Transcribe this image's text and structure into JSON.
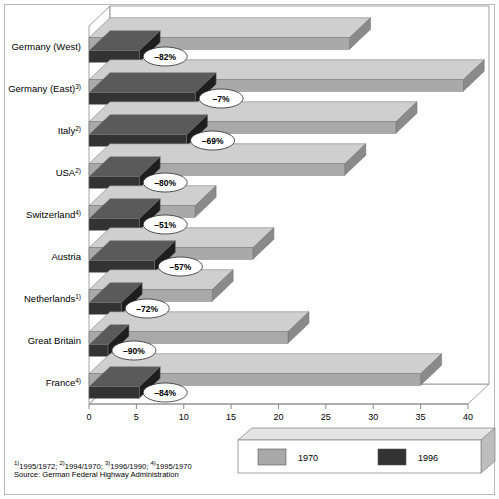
{
  "chart_data": {
    "type": "bar",
    "orientation": "horizontal",
    "title": "Fatalities per billion vehicle miles",
    "xlabel": "",
    "ylabel": "",
    "xlim": [
      0,
      40
    ],
    "xticks": [
      0,
      5,
      10,
      15,
      20,
      25,
      30,
      35,
      40
    ],
    "xtick_labels": [
      "0",
      "5",
      "10",
      "15",
      "20",
      "25",
      "30",
      "35",
      "40"
    ],
    "grid": false,
    "legend_position": "bottom-right",
    "style_3d": true,
    "categories": [
      "Germany (West)",
      "Germany (East)",
      "Italy",
      "USA",
      "Switzerland",
      "Austria",
      "Netherlands",
      "Great Britain",
      "France"
    ],
    "category_footnote_marks": [
      "",
      "3)",
      "2)",
      "2)",
      "4)",
      "",
      "1)",
      "",
      "4)"
    ],
    "series": [
      {
        "name": "1970",
        "color": "#a9a9a9",
        "values": [
          27.5,
          39.5,
          32.4,
          27.0,
          11.2,
          17.3,
          13.0,
          21.0,
          35.0
        ]
      },
      {
        "name": "1996",
        "color": "#333333",
        "values": [
          5.3,
          11.2,
          10.3,
          5.3,
          5.3,
          6.9,
          3.4,
          2.0,
          5.3
        ]
      }
    ],
    "annotations": [
      "–82%",
      "–7%",
      "–69%",
      "–80%",
      "–51%",
      "–57%",
      "–72%",
      "–90%",
      "–84%"
    ],
    "annotation_note": "percent change between the two years shown per country"
  },
  "legend": {
    "entries": [
      {
        "label": "1970",
        "color": "#a9a9a9"
      },
      {
        "label": "1996",
        "color": "#333333"
      }
    ]
  },
  "footer": {
    "footnotes_prefix_1": "1)",
    "footnotes_text_1": "1995/1972;  ",
    "footnotes_prefix_2": "2)",
    "footnotes_text_2": "1994/1970;  ",
    "footnotes_prefix_3": "3)",
    "footnotes_text_3": "1996/1990;  ",
    "footnotes_prefix_4": "4)",
    "footnotes_text_4": "1995/1970",
    "footnotes_full": "1)1995/1972;  2)1994/1970;  3)1996/1990;  4)1995/1970",
    "source": "Source: German Federal Highway Administration"
  },
  "colors": {
    "bar_1970_front": "#a9a9a9",
    "bar_1970_top": "#cfcfcf",
    "bar_1970_side": "#8a8a8a",
    "bar_1996_front": "#333333",
    "bar_1996_top": "#5a5a5a",
    "bar_1996_side": "#1e1e1e",
    "axis": "#8a8a8a",
    "frame": "#b9b9b9",
    "background": "#ffffff"
  }
}
